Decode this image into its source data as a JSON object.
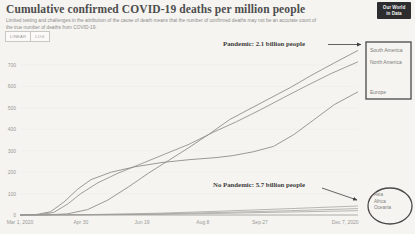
{
  "header": {
    "title": "Cumulative confirmed COVID-19 deaths per million people",
    "subtitle": "Limited testing and challenges in the attribution of the cause of death means that the number of confirmed deaths may not be an accurate count of the true number of deaths from COVID-19.",
    "logo_line1": "Our World",
    "logo_line2": "in Data"
  },
  "toolbar": {
    "linear_label": "LINEAR",
    "log_label": "LOG"
  },
  "annotations": {
    "pandemic": "Pandemic: 2.1 billion people",
    "no_pandemic": "No Pandemic: 5.7 billion people"
  },
  "colors": {
    "line_gray": "#8f8e8b",
    "line_gray_light": "#9c9b98",
    "axis": "#9a9996",
    "grid": "#eceae6",
    "shape_stroke": "#4a4948",
    "arrow": "#3f3e3c"
  },
  "chart_data": {
    "type": "line",
    "title": "Cumulative confirmed COVID-19 deaths per million people",
    "xlabel": "",
    "ylabel": "deaths per million people",
    "ylim": [
      0,
      800
    ],
    "grid": "faint horizontal",
    "legend_position": "right-end annotations (box and ellipse)",
    "x_ticks": [
      {
        "label": "Mar 1, 2020",
        "f": 0.0
      },
      {
        "label": "Apr 30",
        "f": 0.18
      },
      {
        "label": "Jun 19",
        "f": 0.361
      },
      {
        "label": "Aug 8",
        "f": 0.541
      },
      {
        "label": "Sep 27",
        "f": 0.71
      },
      {
        "label": "Dec 7, 2020",
        "f": 0.962
      }
    ],
    "y_ticks": [
      0,
      100,
      200,
      300,
      400,
      500,
      600,
      700
    ],
    "groups": [
      {
        "id": "pandemic",
        "label": "Pandemic: 2.1 billion people",
        "members": [
          "South America",
          "North America",
          "Europe"
        ]
      },
      {
        "id": "no_pandemic",
        "label": "No Pandemic: 5.7 billion people",
        "members": [
          "Asia",
          "Africa",
          "Oceania"
        ]
      }
    ],
    "series": [
      {
        "name": "South America",
        "group": "pandemic",
        "color": "#8f8e8b",
        "width": 0.9,
        "points": [
          [
            0,
            0
          ],
          [
            0.08,
            1
          ],
          [
            0.14,
            5
          ],
          [
            0.2,
            25
          ],
          [
            0.26,
            70
          ],
          [
            0.32,
            130
          ],
          [
            0.38,
            195
          ],
          [
            0.44,
            255
          ],
          [
            0.5,
            315
          ],
          [
            0.56,
            378
          ],
          [
            0.62,
            445
          ],
          [
            0.68,
            495
          ],
          [
            0.74,
            545
          ],
          [
            0.8,
            595
          ],
          [
            0.86,
            650
          ],
          [
            0.93,
            710
          ],
          [
            1.0,
            768
          ]
        ]
      },
      {
        "name": "North America",
        "group": "pandemic",
        "color": "#949390",
        "width": 0.9,
        "points": [
          [
            0,
            0
          ],
          [
            0.06,
            2
          ],
          [
            0.1,
            12
          ],
          [
            0.14,
            50
          ],
          [
            0.18,
            100
          ],
          [
            0.23,
            150
          ],
          [
            0.29,
            195
          ],
          [
            0.36,
            240
          ],
          [
            0.43,
            285
          ],
          [
            0.5,
            330
          ],
          [
            0.57,
            385
          ],
          [
            0.64,
            435
          ],
          [
            0.71,
            490
          ],
          [
            0.78,
            548
          ],
          [
            0.85,
            605
          ],
          [
            0.92,
            660
          ],
          [
            1.0,
            715
          ]
        ]
      },
      {
        "name": "Europe",
        "group": "pandemic",
        "color": "#8f8e8b",
        "width": 0.9,
        "points": [
          [
            0,
            0
          ],
          [
            0.05,
            3
          ],
          [
            0.09,
            15
          ],
          [
            0.13,
            60
          ],
          [
            0.17,
            120
          ],
          [
            0.21,
            165
          ],
          [
            0.27,
            200
          ],
          [
            0.34,
            225
          ],
          [
            0.42,
            245
          ],
          [
            0.5,
            258
          ],
          [
            0.58,
            268
          ],
          [
            0.63,
            277
          ],
          [
            0.69,
            295
          ],
          [
            0.75,
            320
          ],
          [
            0.81,
            375
          ],
          [
            0.87,
            445
          ],
          [
            0.93,
            515
          ],
          [
            1.0,
            575
          ]
        ]
      },
      {
        "name": "Asia",
        "group": "no_pandemic",
        "color": "#9c9b98",
        "width": 0.7,
        "points": [
          [
            0,
            0
          ],
          [
            0.2,
            2
          ],
          [
            0.4,
            8
          ],
          [
            0.6,
            18
          ],
          [
            0.8,
            30
          ],
          [
            1.0,
            42
          ]
        ]
      },
      {
        "name": "Africa",
        "group": "no_pandemic",
        "color": "#9c9b98",
        "width": 0.7,
        "points": [
          [
            0,
            0
          ],
          [
            0.2,
            1
          ],
          [
            0.4,
            5
          ],
          [
            0.6,
            12
          ],
          [
            0.8,
            20
          ],
          [
            1.0,
            30
          ]
        ]
      },
      {
        "name": "Oceania",
        "group": "no_pandemic",
        "color": "#9c9b98",
        "width": 0.7,
        "points": [
          [
            0,
            0
          ],
          [
            0.2,
            1
          ],
          [
            0.4,
            3
          ],
          [
            0.6,
            8
          ],
          [
            0.8,
            14
          ],
          [
            1.0,
            20
          ]
        ]
      }
    ]
  }
}
